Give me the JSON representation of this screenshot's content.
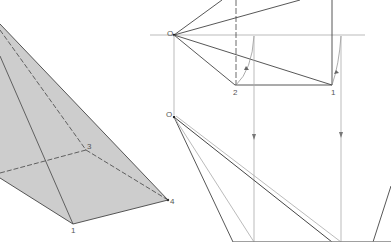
{
  "figure_left": {
    "title": "oblique pyramid",
    "fill_color": "#cccccc",
    "stroke_color": "#444444",
    "labels": {
      "v1": "1",
      "v3": "3",
      "v4": "4"
    }
  },
  "figure_right": {
    "stroke_color": "#444444",
    "construction_color": "#aaaaaa",
    "labels": {
      "o_top": "O",
      "o_bottom": "O",
      "v1": "1",
      "v2": "2"
    }
  }
}
